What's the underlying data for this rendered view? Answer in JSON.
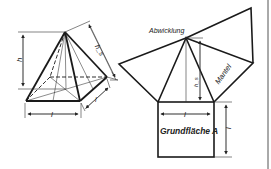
{
  "figure": {
    "labels": {
      "height": "h",
      "slant_height": "h_s",
      "base_edge_front": "l",
      "base_edge_side": "l",
      "net_title": "Abwicklung",
      "lateral_surface": "Mantel",
      "net_slant_height": "h_s",
      "net_base_edge_horizontal": "l",
      "net_base_edge_vertical": "l",
      "base_area": "Grundfläche A"
    },
    "colors": {
      "line": "#1a1a1a",
      "thin": "#333333",
      "background": "#ffffff"
    }
  }
}
